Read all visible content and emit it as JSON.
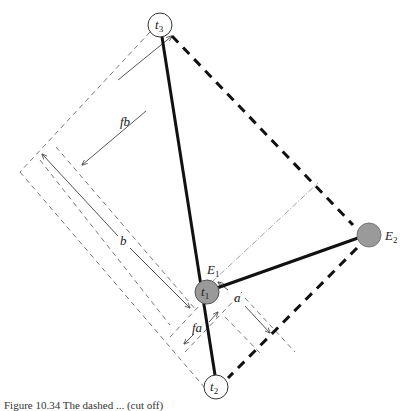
{
  "figure": {
    "nodes": {
      "t3": {
        "label": "t",
        "sub": "3"
      },
      "t1": {
        "label": "t",
        "sub": "1"
      },
      "t2": {
        "label": "t",
        "sub": "2"
      },
      "E1": {
        "label": "E",
        "sub": "1"
      },
      "E2": {
        "label": "E",
        "sub": "2"
      }
    },
    "dimensions": {
      "fb": "fb",
      "b": "b",
      "a": "a",
      "fa": "fa"
    },
    "colors": {
      "line": "#111111",
      "thin_line": "#666666",
      "node_fill": "#9a9a9a",
      "node_open_fill": "#ffffff"
    }
  },
  "caption": {
    "text": "Figure 10.34 The dashed ... (cut off)"
  }
}
